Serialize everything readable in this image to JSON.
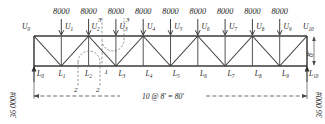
{
  "diagram": {
    "type": "truss-load-diagram",
    "units": "pounds and feet",
    "geometry": {
      "panels": 10,
      "panel_length": "8'",
      "span": "80'",
      "height": "8'",
      "height_label": "8'",
      "span_label": "10 @ 8' = 80'"
    },
    "loads": {
      "value": "8000",
      "count": 9,
      "applied_at": [
        "U1",
        "U2",
        "U3",
        "U4",
        "U5",
        "U6",
        "U7",
        "U8",
        "U9"
      ],
      "values": [
        "8000",
        "8000",
        "8000",
        "8000",
        "8000",
        "8000",
        "8000",
        "8000",
        "8000"
      ]
    },
    "reactions": {
      "left": "36 000#",
      "right": "36 000#",
      "left_node": "L0",
      "right_node": "L10"
    },
    "top_nodes": [
      {
        "id": "U0",
        "letter": "U",
        "sub": "0"
      },
      {
        "id": "U1",
        "letter": "U",
        "sub": "1"
      },
      {
        "id": "U2",
        "letter": "U",
        "sub": "2"
      },
      {
        "id": "U3",
        "letter": "U",
        "sub": "3"
      },
      {
        "id": "U4",
        "letter": "U",
        "sub": "4"
      },
      {
        "id": "U5",
        "letter": "U",
        "sub": "5"
      },
      {
        "id": "U6",
        "letter": "U",
        "sub": "6"
      },
      {
        "id": "U7",
        "letter": "U",
        "sub": "7"
      },
      {
        "id": "U8",
        "letter": "U",
        "sub": "8"
      },
      {
        "id": "U9",
        "letter": "U",
        "sub": "9"
      },
      {
        "id": "U10",
        "letter": "U",
        "sub": "10"
      }
    ],
    "bottom_nodes": [
      {
        "id": "L0",
        "letter": "L",
        "sub": "0"
      },
      {
        "id": "L1",
        "letter": "L",
        "sub": "1"
      },
      {
        "id": "L2",
        "letter": "L",
        "sub": "2"
      },
      {
        "id": "L3",
        "letter": "L",
        "sub": "3"
      },
      {
        "id": "L4",
        "letter": "L",
        "sub": "4"
      },
      {
        "id": "L5",
        "letter": "L",
        "sub": "5"
      },
      {
        "id": "L6",
        "letter": "L",
        "sub": "6"
      },
      {
        "id": "L7",
        "letter": "L",
        "sub": "7"
      },
      {
        "id": "L8",
        "letter": "L",
        "sub": "8"
      },
      {
        "id": "L9",
        "letter": "L",
        "sub": "9"
      },
      {
        "id": "L10",
        "letter": "L",
        "sub": "10"
      }
    ],
    "section_cuts": [
      {
        "id": "cut-3",
        "label": "3",
        "label2": "3",
        "position": "between U2 and U3"
      },
      {
        "id": "cut-1",
        "label": "1",
        "label2": "1",
        "position": "between L2 and L3"
      },
      {
        "id": "cut-2",
        "label": "2",
        "label2": "2",
        "position": "below L2 to L3"
      }
    ]
  }
}
